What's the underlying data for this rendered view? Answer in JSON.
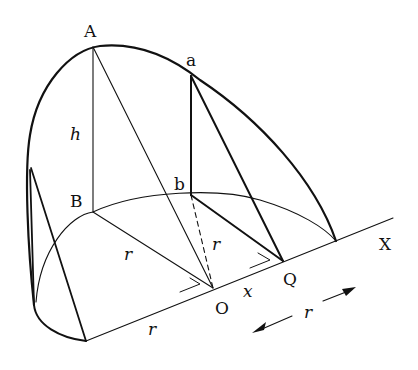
{
  "diagram": {
    "type": "geometric-solid",
    "points": {
      "A": {
        "label": "A",
        "x": 93,
        "y": 47
      },
      "B": {
        "label": "B",
        "x": 93,
        "y": 212
      },
      "a": {
        "label": "a",
        "x": 191,
        "y": 76
      },
      "b": {
        "label": "b",
        "x": 191,
        "y": 195
      },
      "O": {
        "label": "O",
        "x": 213,
        "y": 288
      },
      "Q": {
        "label": "Q",
        "x": 283,
        "y": 261
      },
      "X": {
        "label": "X",
        "x": 393,
        "y": 218
      }
    },
    "labels": {
      "A": "A",
      "a": "a",
      "B": "B",
      "b": "b",
      "O": "O",
      "Q": "Q",
      "X": "X",
      "h": "h",
      "r_BO": "r",
      "r_bQ": "r",
      "r_base": "r",
      "x": "x",
      "r_arrow": "r"
    },
    "colors": {
      "stroke": "#111111",
      "background": "#ffffff"
    }
  }
}
